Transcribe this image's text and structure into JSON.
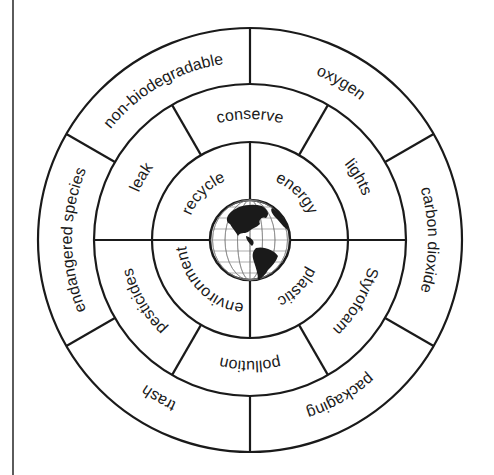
{
  "diagram": {
    "title": "",
    "type": "concentric word wheel",
    "center_icon": "globe-icon",
    "colors": {
      "line": "#1a1a1a",
      "background": "#ffffff",
      "text": "#1a1a1a"
    },
    "rings": {
      "inner": {
        "labels": [
          "recycle",
          "energy",
          "plastic",
          "environment"
        ]
      },
      "middle": {
        "labels": [
          "conserve",
          "lights",
          "Styrofoam",
          "pollution",
          "pesticides",
          "leak"
        ]
      },
      "outer": {
        "labels": [
          "oxygen",
          "carbon dioxide",
          "packaging",
          "trash",
          "endangered species",
          "non-biodegradable"
        ]
      }
    }
  }
}
